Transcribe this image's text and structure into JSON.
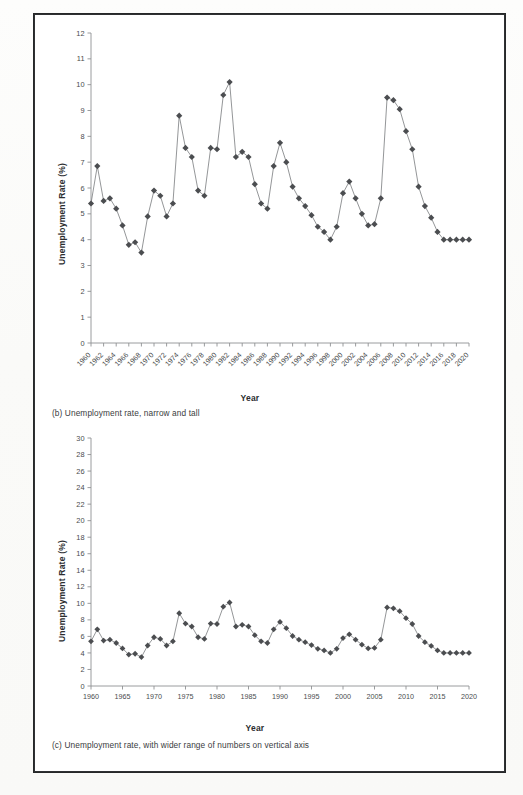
{
  "figure": {
    "panels": [
      {
        "id": "b",
        "caption": "(b) Unemployment rate, narrow and tall",
        "xlabel": "Year",
        "ylabel": "Unemployment Rate (%)"
      },
      {
        "id": "c",
        "caption": "(c) Unemployment rate, with wider range of numbers on vertical axis",
        "xlabel": "Year",
        "ylabel": "Unemployment Rate (%)"
      }
    ]
  },
  "colors": {
    "marker": "#4b4d50",
    "line": "#707376",
    "axis": "#8e9193",
    "frame": "#2f3133",
    "text": "#3a3c3e"
  },
  "chart_data": [
    {
      "type": "line",
      "panel": "b",
      "title": "(b) Unemployment rate, narrow and tall",
      "xlabel": "Year",
      "ylabel": "Unemployment Rate (%)",
      "xlim": [
        1960,
        2020
      ],
      "ylim": [
        0,
        12
      ],
      "ytick_step": 1,
      "yticks": [
        0,
        1,
        2,
        3,
        4,
        5,
        6,
        7,
        8,
        9,
        10,
        11,
        12
      ],
      "xticks": [
        1960,
        1962,
        1964,
        1966,
        1968,
        1970,
        1972,
        1974,
        1976,
        1978,
        1980,
        1982,
        1984,
        1986,
        1988,
        1990,
        1992,
        1994,
        1996,
        1998,
        2000,
        2002,
        2004,
        2006,
        2008,
        2010,
        2012,
        2014,
        2016,
        2018,
        2020
      ],
      "xtick_rotation": -45,
      "grid": false,
      "legend": false,
      "marker": "diamond",
      "x": [
        1960,
        1961,
        1962,
        1963,
        1964,
        1965,
        1966,
        1967,
        1968,
        1969,
        1970,
        1971,
        1972,
        1973,
        1974,
        1975,
        1976,
        1977,
        1978,
        1979,
        1980,
        1981,
        1982,
        1983,
        1984,
        1985,
        1986,
        1987,
        1988,
        1989,
        1990,
        1991,
        1992,
        1993,
        1994,
        1995,
        1996,
        1997,
        1998,
        1999,
        2000,
        2001,
        2002,
        2003,
        2004,
        2005,
        2006,
        2007,
        2008,
        2009,
        2010,
        2011,
        2012,
        2013,
        2014,
        2015,
        2016,
        2017,
        2018,
        2019,
        2020
      ],
      "values": [
        5.4,
        6.85,
        5.5,
        5.6,
        5.2,
        4.55,
        3.8,
        3.9,
        3.5,
        4.9,
        5.9,
        5.7,
        4.9,
        5.4,
        8.8,
        7.55,
        7.2,
        5.9,
        5.7,
        7.55,
        7.5,
        9.6,
        10.1,
        7.2,
        7.4,
        7.2,
        6.15,
        5.4,
        5.2,
        6.85,
        7.75,
        7.0,
        6.05,
        5.6,
        5.3,
        4.95,
        4.5,
        4.3,
        4.0,
        4.5,
        5.8,
        6.25,
        5.6,
        5.0,
        4.55,
        4.6,
        5.6,
        9.5,
        9.4,
        9.05,
        8.2,
        7.5,
        6.05,
        5.3,
        4.85,
        4.3,
        4.0,
        4.0,
        4.0,
        4.0,
        4.0
      ]
    },
    {
      "type": "line",
      "panel": "c",
      "title": "(c) Unemployment rate, with wider range of numbers on vertical axis",
      "xlabel": "Year",
      "ylabel": "Unemployment Rate (%)",
      "xlim": [
        1960,
        2020
      ],
      "ylim": [
        0,
        30
      ],
      "ytick_step": 2,
      "yticks": [
        0,
        2,
        4,
        6,
        8,
        10,
        12,
        14,
        16,
        18,
        20,
        22,
        24,
        26,
        28,
        30
      ],
      "xticks": [
        1960,
        1965,
        1970,
        1975,
        1980,
        1985,
        1990,
        1995,
        2000,
        2005,
        2010,
        2015,
        2020
      ],
      "xtick_rotation": 0,
      "grid": false,
      "legend": false,
      "marker": "diamond",
      "x": [
        1960,
        1961,
        1962,
        1963,
        1964,
        1965,
        1966,
        1967,
        1968,
        1969,
        1970,
        1971,
        1972,
        1973,
        1974,
        1975,
        1976,
        1977,
        1978,
        1979,
        1980,
        1981,
        1982,
        1983,
        1984,
        1985,
        1986,
        1987,
        1988,
        1989,
        1990,
        1991,
        1992,
        1993,
        1994,
        1995,
        1996,
        1997,
        1998,
        1999,
        2000,
        2001,
        2002,
        2003,
        2004,
        2005,
        2006,
        2007,
        2008,
        2009,
        2010,
        2011,
        2012,
        2013,
        2014,
        2015,
        2016,
        2017,
        2018,
        2019,
        2020
      ],
      "values": [
        5.4,
        6.85,
        5.5,
        5.6,
        5.2,
        4.55,
        3.8,
        3.9,
        3.5,
        4.9,
        5.9,
        5.7,
        4.9,
        5.4,
        8.8,
        7.55,
        7.2,
        5.9,
        5.7,
        7.55,
        7.5,
        9.6,
        10.1,
        7.2,
        7.4,
        7.2,
        6.15,
        5.4,
        5.2,
        6.85,
        7.75,
        7.0,
        6.05,
        5.6,
        5.3,
        4.95,
        4.5,
        4.3,
        4.0,
        4.5,
        5.8,
        6.25,
        5.6,
        5.0,
        4.55,
        4.6,
        5.6,
        9.5,
        9.4,
        9.05,
        8.2,
        7.5,
        6.05,
        5.3,
        4.85,
        4.3,
        4.0,
        4.0,
        4.0,
        4.0,
        4.0
      ]
    }
  ]
}
